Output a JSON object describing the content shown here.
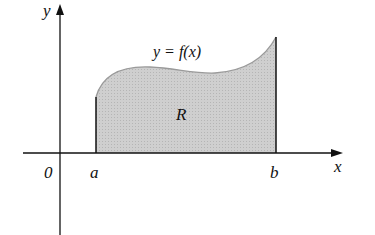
{
  "figure": {
    "axis_labels": {
      "x": "x",
      "y": "y"
    },
    "origin_label": "0",
    "curve_label": "y = f(x)",
    "region_label": "R",
    "bounds": {
      "left": "a",
      "right": "b"
    },
    "colors": {
      "region_fill": "#c8c8c8",
      "curve": "#9a9a9a",
      "axis": "#111111",
      "background": "#ffffff"
    }
  }
}
